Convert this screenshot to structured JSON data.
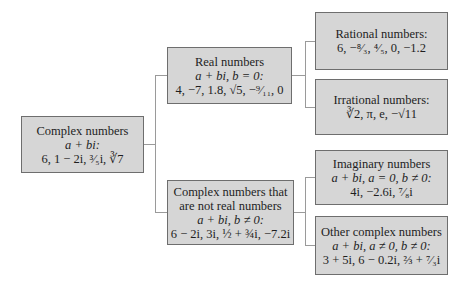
{
  "diagram": {
    "type": "tree",
    "nodes": {
      "complex": {
        "title": "Complex numbers",
        "form": "a + bi:",
        "examples": "6, 1 − 2i, ³⁄₅i, ∛7"
      },
      "real": {
        "title": "Real numbers",
        "form": "a + bi, b = 0:",
        "examples": "4, −7, 1.8, √5, −⁹⁄₁₁, 0"
      },
      "not_real": {
        "title_line1": "Complex numbers that",
        "title_line2": "are not real numbers",
        "form": "a + bi, b ≠ 0:",
        "examples": "6 − 2i, 3i, ½ + ¾i, −7.2i"
      },
      "rational": {
        "title": "Rational numbers:",
        "examples": "6, −⁸⁄₃, ⁴⁄₅, 0, −1.2"
      },
      "irrational": {
        "title": "Irrational numbers:",
        "examples": "∛2, π, e, −√11"
      },
      "imaginary": {
        "title": "Imaginary numbers",
        "form": "a + bi, a = 0, b ≠ 0:",
        "examples": "4i, −2.6i, ⁷⁄₈i"
      },
      "other": {
        "title": "Other complex numbers",
        "form": "a + bi, a ≠ 0, b ≠ 0:",
        "examples": "3 + 5i, 6 − 0.2i, ⅔ + ⁷⁄₃i"
      }
    },
    "edges": [
      [
        "complex",
        "real"
      ],
      [
        "complex",
        "not_real"
      ],
      [
        "real",
        "rational"
      ],
      [
        "real",
        "irrational"
      ],
      [
        "not_real",
        "imaginary"
      ],
      [
        "not_real",
        "other"
      ]
    ],
    "colors": {
      "box_fill": "#d6d6d6",
      "box_border": "#6e6e6e",
      "connector": "#9a9a9a"
    }
  }
}
